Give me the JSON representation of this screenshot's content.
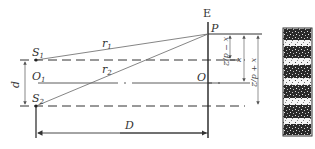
{
  "diagram": {
    "labels": {
      "screen": "E",
      "point_p": "P",
      "origin_o": "O",
      "origin_o1": "O",
      "origin_o1_sub": "1",
      "slit1": "S",
      "slit1_sub": "1",
      "slit2": "S",
      "slit2_sub": "2",
      "ray1": "r",
      "ray1_sub": "1",
      "ray2": "r",
      "ray2_sub": "2",
      "slit_separation": "d",
      "screen_distance": "D",
      "dim_x_minus": "x − d/2",
      "dim_x": "x",
      "dim_x_plus": "x + d/2"
    },
    "colors": {
      "line": "#333333",
      "thin_line": "#777777",
      "fringe_dark": "#2a2a2a",
      "fringe_light": "#f2f2f2"
    },
    "fringes": {
      "count_dark": 5,
      "description": "alternating dark and bright horizontal interference fringes"
    }
  }
}
